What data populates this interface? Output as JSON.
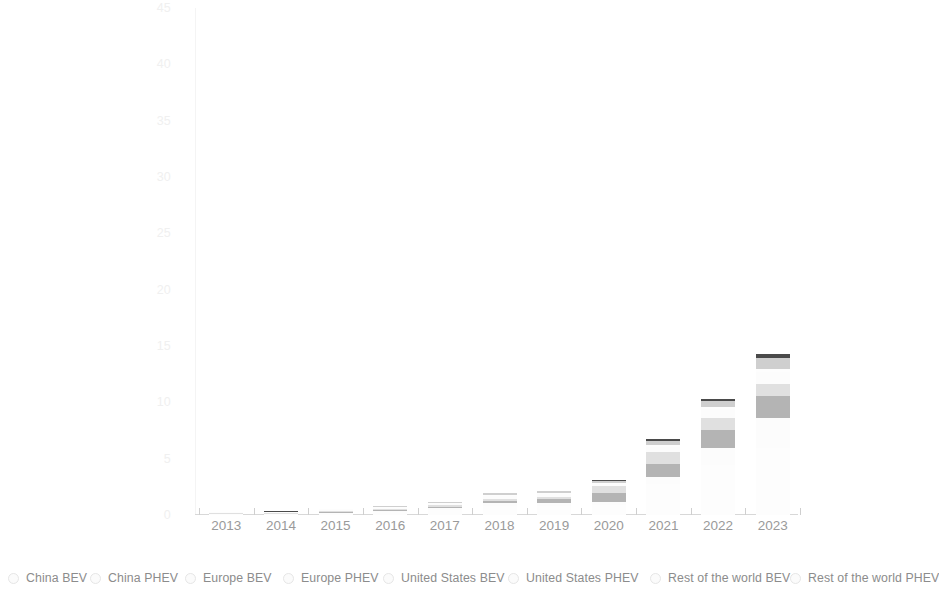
{
  "chart_data": {
    "type": "bar",
    "title": "",
    "subtitle": "",
    "xlabel": "",
    "ylabel": "",
    "stacked": true,
    "grid": false,
    "legend_position": "bottom",
    "categories": [
      "2013",
      "2014",
      "2015",
      "2016",
      "2017",
      "2018",
      "2019",
      "2020",
      "2021",
      "2022",
      "2023"
    ],
    "ylim": [
      0,
      45
    ],
    "yticks": [
      "0",
      "5",
      "10",
      "15",
      "20",
      "25",
      "30",
      "35",
      "40",
      "45"
    ],
    "ytick_values": [
      0,
      5,
      10,
      15,
      20,
      25,
      30,
      35,
      40,
      45
    ],
    "series": [
      {
        "name": "China BEV",
        "color": "#fdfdfd",
        "values": [
          0.08,
          0.05,
          0.15,
          0.26,
          0.47,
          0.79,
          0.83,
          0.93,
          2.74,
          4.43,
          5.99
        ]
      },
      {
        "name": "China PHEV",
        "color": "#fcfcfc",
        "values": [
          0.01,
          0.02,
          0.06,
          0.08,
          0.11,
          0.27,
          0.23,
          0.25,
          0.61,
          1.52,
          2.62
        ]
      },
      {
        "name": "Europe BEV",
        "color": "#b4b4b4",
        "values": [
          0.03,
          0.05,
          0.09,
          0.11,
          0.15,
          0.22,
          0.37,
          0.74,
          1.19,
          1.57,
          1.99
        ]
      },
      {
        "name": "Europe PHEV",
        "color": "#e0e0e0",
        "values": [
          0.02,
          0.04,
          0.09,
          0.11,
          0.14,
          0.18,
          0.19,
          0.62,
          1.05,
          1.05,
          1.01
        ]
      },
      {
        "name": "United States BEV",
        "color": "#fcfcfc",
        "values": [
          0.05,
          0.06,
          0.07,
          0.09,
          0.1,
          0.24,
          0.24,
          0.23,
          0.49,
          0.8,
          1.1
        ]
      },
      {
        "name": "United States PHEV",
        "color": "#fdfdfd",
        "values": [
          0.05,
          0.06,
          0.06,
          0.07,
          0.09,
          0.12,
          0.08,
          0.07,
          0.18,
          0.19,
          0.29
        ]
      },
      {
        "name": "Rest of the world BEV",
        "color": "#cfcfcf",
        "values": [
          0.02,
          0.03,
          0.04,
          0.05,
          0.08,
          0.12,
          0.17,
          0.22,
          0.35,
          0.56,
          0.9
        ]
      },
      {
        "name": "Rest of the world PHEV",
        "color": "#4a4a4a",
        "values": [
          0.01,
          0.01,
          0.02,
          0.02,
          0.03,
          0.04,
          0.05,
          0.07,
          0.12,
          0.21,
          0.36
        ]
      }
    ],
    "totals": [
      0.27,
      0.32,
      0.58,
      0.79,
      1.17,
      1.98,
      2.16,
      3.13,
      6.73,
      10.33,
      14.26
    ]
  },
  "legend": {
    "items": [
      {
        "label": "China BEV",
        "marker": "circle-marker-icon"
      },
      {
        "label": "China PHEV",
        "marker": "circle-marker-icon"
      },
      {
        "label": "Europe BEV",
        "marker": "circle-marker-icon"
      },
      {
        "label": "Europe PHEV",
        "marker": "circle-marker-icon"
      },
      {
        "label": "United States BEV",
        "marker": "circle-marker-icon"
      },
      {
        "label": "United States PHEV",
        "marker": "circle-marker-icon"
      },
      {
        "label": "Rest of the world BEV",
        "marker": "circle-marker-icon"
      },
      {
        "label": "Rest of the world PHEV",
        "marker": "circle-marker-icon"
      }
    ]
  }
}
